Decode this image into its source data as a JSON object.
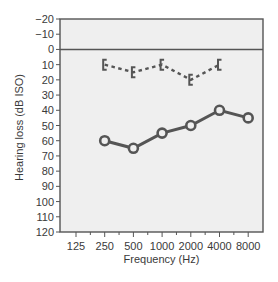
{
  "chart_data": {
    "type": "line",
    "title": "",
    "xlabel": "Frequency (Hz)",
    "ylabel": "Hearing loss (dB ISO)",
    "x_scale": "log2",
    "y_inverted": true,
    "ylim": [
      -20,
      120
    ],
    "grid": false,
    "legend": null,
    "x_ticks": [
      125,
      250,
      500,
      1000,
      2000,
      4000,
      8000
    ],
    "x_tick_labels": [
      "125",
      "250",
      "500",
      "1000",
      "2000",
      "4000",
      "8000"
    ],
    "y_ticks": [
      -20,
      -10,
      0,
      10,
      20,
      30,
      40,
      50,
      60,
      70,
      80,
      90,
      100,
      110,
      120
    ],
    "y_tick_labels": [
      "−20",
      "−10",
      "0",
      "10",
      "20",
      "30",
      "40",
      "50",
      "60",
      "70",
      "80",
      "90",
      "100",
      "110",
      "120"
    ],
    "reference_line": {
      "y": 0
    },
    "series": [
      {
        "name": "Air conduction",
        "style": "solid",
        "marker": "circle",
        "x": [
          250,
          500,
          1000,
          2000,
          4000,
          8000
        ],
        "values": [
          60,
          65,
          55,
          50,
          40,
          45
        ]
      },
      {
        "name": "Bone conduction",
        "style": "dashed",
        "marker": "bracket",
        "x": [
          250,
          500,
          1000,
          2000,
          4000
        ],
        "values": [
          10,
          15,
          10,
          20,
          10
        ]
      }
    ]
  },
  "colors": {
    "plot_bg": "#efefef",
    "frame": "#555555",
    "air_line": "#555555",
    "bone_line": "#555555",
    "text": "#3a3a3a"
  }
}
